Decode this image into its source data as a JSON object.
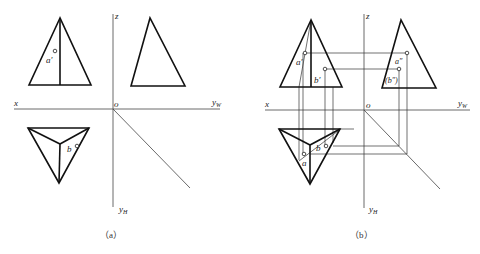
{
  "figure": {
    "panels": [
      {
        "id": "a",
        "caption": "（a）",
        "axes": {
          "x": "x",
          "z": "z",
          "o": "o",
          "yw": "y",
          "yw_sub": "W",
          "yh": "y",
          "yh_sub": "H"
        },
        "points": {
          "a_prime": "a′",
          "b": "b"
        }
      },
      {
        "id": "b",
        "caption": "（b）",
        "axes": {
          "x": "x",
          "z": "z",
          "o": "o",
          "yw": "y",
          "yw_sub": "W",
          "yh": "y",
          "yh_sub": "H"
        },
        "points": {
          "a_prime": "a′",
          "b_prime": "b′",
          "a_double_prime": "a″",
          "b_double_prime": "(b″)",
          "a": "a",
          "b": "b"
        }
      }
    ],
    "colors": {
      "line": "#111111",
      "background": "#ffffff"
    }
  }
}
